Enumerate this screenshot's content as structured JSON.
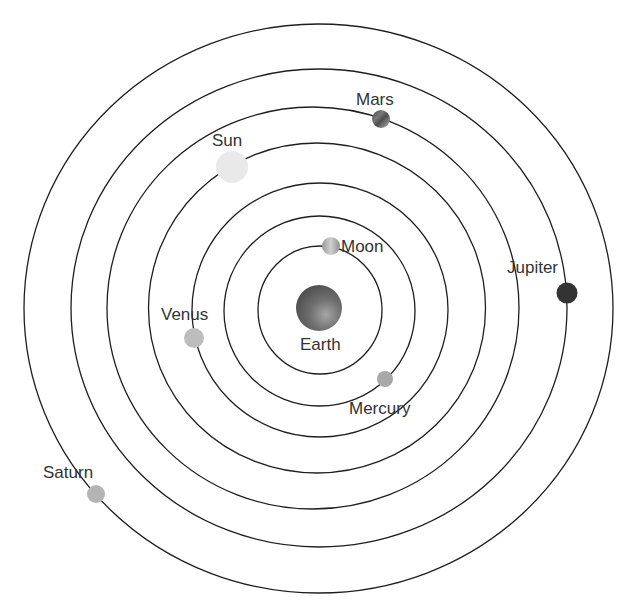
{
  "diagram": {
    "center_body": "Earth",
    "orbits": [
      {
        "cx": 320,
        "cy": 310,
        "rx": 62,
        "ry": 64
      },
      {
        "cx": 319.5,
        "cy": 311,
        "rx": 95.5,
        "ry": 95
      },
      {
        "cx": 320,
        "cy": 310,
        "rx": 128,
        "ry": 127
      },
      {
        "cx": 317,
        "cy": 308,
        "rx": 168.5,
        "ry": 165
      },
      {
        "cx": 313,
        "cy": 308,
        "rx": 206,
        "ry": 201
      },
      {
        "cx": 319,
        "cy": 308,
        "rx": 248,
        "ry": 239
      },
      {
        "cx": 318.5,
        "cy": 308.5,
        "rx": 294.5,
        "ry": 284.5
      }
    ],
    "bodies": [
      {
        "name": "Earth",
        "label": "Earth",
        "cx": 319,
        "cy": 308,
        "r": 23,
        "fill": "url(#earthGrad)",
        "label_x": 300,
        "label_y": 350
      },
      {
        "name": "Moon",
        "label": "Moon",
        "cx": 331,
        "cy": 246,
        "r": 9,
        "fill": "url(#moonGrad)",
        "label_x": 341,
        "label_y": 252
      },
      {
        "name": "Mercury",
        "label": "Mercury",
        "cx": 385,
        "cy": 379,
        "r": 8,
        "fill": "#a8a8a8",
        "label_x": 349,
        "label_y": 414
      },
      {
        "name": "Venus",
        "label": "Venus",
        "cx": 194,
        "cy": 338,
        "r": 10,
        "fill": "#bdbdbd",
        "label_x": 161,
        "label_y": 320
      },
      {
        "name": "Sun",
        "label": "Sun",
        "cx": 232,
        "cy": 167,
        "r": 16,
        "fill": "#e9e9e9",
        "label_x": 212,
        "label_y": 146
      },
      {
        "name": "Mars",
        "label": "Mars",
        "cx": 381,
        "cy": 119,
        "r": 9,
        "fill": "url(#marsGrad)",
        "label_x": 356,
        "label_y": 105
      },
      {
        "name": "Jupiter",
        "label": "Jupiter",
        "cx": 567,
        "cy": 293,
        "r": 10.5,
        "fill": "#333333",
        "label_x": 507,
        "label_y": 273
      },
      {
        "name": "Saturn",
        "label": "Saturn",
        "cx": 96,
        "cy": 494,
        "r": 9,
        "fill": "#b4b4b4",
        "label_x": 43,
        "label_y": 478
      }
    ]
  },
  "labels": {
    "earth": "Earth",
    "moon": "Moon",
    "mercury": "Mercury",
    "venus": "Venus",
    "sun": "Sun",
    "mars": "Mars",
    "jupiter": "Jupiter",
    "saturn": "Saturn"
  }
}
